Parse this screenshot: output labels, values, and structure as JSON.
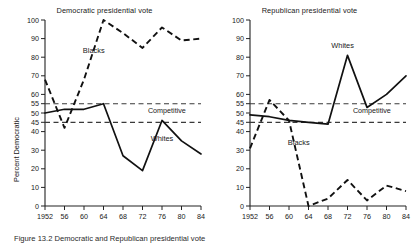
{
  "figure": {
    "caption": "Figure 13.2   Democratic and Republican presidential vote"
  },
  "panels": [
    {
      "key": "democratic",
      "title": "Democratic presidential vote",
      "ylabel": "Percent Democratic",
      "competitive_label": "Competitive",
      "series_labels": {
        "blacks": "Blacks",
        "whites": "Whites"
      }
    },
    {
      "key": "republican",
      "title": "Republican presidential vote",
      "ylabel": "Percent Republican",
      "competitive_label": "Competitive",
      "series_labels": {
        "blacks": "Blacks",
        "whites": "Whites"
      }
    }
  ],
  "axis": {
    "yticks": [
      0,
      10,
      20,
      30,
      40,
      45,
      50,
      55,
      60,
      70,
      80,
      90,
      100
    ],
    "ytick_labels": [
      "0",
      "10",
      "20",
      "30",
      "40",
      "45",
      "50",
      "55",
      "60",
      "70",
      "80",
      "90",
      "100"
    ],
    "ylim": [
      0,
      100
    ],
    "xticks": [
      1952,
      1956,
      1960,
      1964,
      1968,
      1972,
      1976,
      1980,
      1984
    ],
    "xtick_labels": [
      "1952",
      "56",
      "60",
      "64",
      "68",
      "72",
      "76",
      "80",
      "84"
    ],
    "xlim": [
      1952,
      1984
    ],
    "reference_lines": [
      55,
      45
    ]
  },
  "chart_data": [
    {
      "type": "line",
      "title": "Democratic presidential vote",
      "xlabel": "",
      "ylabel": "Percent Democratic",
      "ylim": [
        0,
        100
      ],
      "xlim": [
        1952,
        1984
      ],
      "grid": false,
      "legend": "inline-annotations",
      "categories": [
        1952,
        1956,
        1960,
        1964,
        1968,
        1972,
        1976,
        1980,
        1984
      ],
      "tick_labels": [
        "1952",
        "56",
        "60",
        "64",
        "68",
        "72",
        "76",
        "80",
        "84"
      ],
      "annotations": [
        {
          "text": "Blacks",
          "x": 1962,
          "y": 82
        },
        {
          "text": "Whites",
          "x": 1976,
          "y": 35
        },
        {
          "text": "Competitive",
          "x": 1977,
          "y": 50
        }
      ],
      "reference_lines": [
        {
          "y": 55,
          "style": "dashed",
          "label": "Competitive upper bound"
        },
        {
          "y": 45,
          "style": "dashed",
          "label": "Competitive lower bound"
        }
      ],
      "series": [
        {
          "name": "Blacks",
          "style": "dashed",
          "values": [
            68,
            42,
            68,
            100,
            93,
            85,
            96,
            89,
            90
          ]
        },
        {
          "name": "Whites",
          "style": "solid",
          "values": [
            50,
            52,
            52,
            55,
            27,
            19,
            46,
            35,
            28
          ]
        }
      ]
    },
    {
      "type": "line",
      "title": "Republican presidential vote",
      "xlabel": "",
      "ylabel": "Percent Republican",
      "ylim": [
        0,
        100
      ],
      "xlim": [
        1952,
        1984
      ],
      "grid": false,
      "legend": "inline-annotations",
      "categories": [
        1952,
        1956,
        1960,
        1964,
        1968,
        1972,
        1976,
        1980,
        1984
      ],
      "tick_labels": [
        "1952",
        "56",
        "60",
        "64",
        "68",
        "72",
        "76",
        "80",
        "84"
      ],
      "annotations": [
        {
          "text": "Whites",
          "x": 1971,
          "y": 85
        },
        {
          "text": "Blacks",
          "x": 1962,
          "y": 33
        },
        {
          "text": "Competitive",
          "x": 1977,
          "y": 50
        }
      ],
      "reference_lines": [
        {
          "y": 55,
          "style": "dashed",
          "label": "Competitive upper bound"
        },
        {
          "y": 45,
          "style": "dashed",
          "label": "Competitive lower bound"
        }
      ],
      "series": [
        {
          "name": "Whites",
          "style": "solid",
          "values": [
            49,
            48,
            46,
            45,
            44,
            81,
            53,
            60,
            70
          ]
        },
        {
          "name": "Blacks",
          "style": "dashed",
          "values": [
            31,
            57,
            46,
            0,
            4,
            14,
            3,
            11,
            8
          ]
        }
      ]
    }
  ],
  "colors": {
    "ink": "#1a1a1a",
    "axis": "#222222",
    "reference": "#444444",
    "background": "#ffffff"
  }
}
